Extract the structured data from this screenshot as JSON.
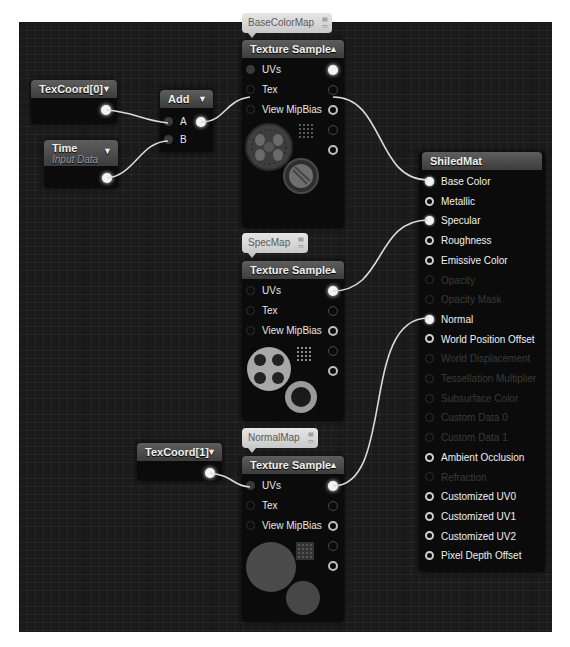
{
  "graph": {
    "nodes": {
      "texcoord0": {
        "title": "TexCoord[0]",
        "expand_icon": "chevron-down-icon"
      },
      "time": {
        "title": "Time",
        "subtitle": "Input Data",
        "expand_icon": "chevron-down-icon"
      },
      "add": {
        "title": "Add",
        "inputs": [
          "A",
          "B"
        ],
        "expand_icon": "chevron-down-icon"
      },
      "texcoord1": {
        "title": "TexCoord[1]",
        "expand_icon": "chevron-down-icon"
      },
      "tex_base": {
        "comment": "BaseColorMap",
        "title": "Texture Sample",
        "collapse_icon": "chevron-up-icon",
        "inputs": [
          "UVs",
          "Tex",
          "View MipBias"
        ]
      },
      "tex_spec": {
        "comment": "SpecMap",
        "title": "Texture Sample",
        "collapse_icon": "chevron-up-icon",
        "inputs": [
          "UVs",
          "Tex",
          "View MipBias"
        ]
      },
      "tex_normal": {
        "comment": "NormalMap",
        "title": "Texture Sample",
        "collapse_icon": "chevron-up-icon",
        "inputs": [
          "UVs",
          "Tex",
          "View MipBias"
        ]
      },
      "material": {
        "title": "ShiledMat",
        "inputs": [
          {
            "label": "Base Color",
            "enabled": true,
            "connected": true
          },
          {
            "label": "Metallic",
            "enabled": true,
            "connected": false
          },
          {
            "label": "Specular",
            "enabled": true,
            "connected": true
          },
          {
            "label": "Roughness",
            "enabled": true,
            "connected": false
          },
          {
            "label": "Emissive Color",
            "enabled": true,
            "connected": false
          },
          {
            "label": "Opacity",
            "enabled": false,
            "connected": false
          },
          {
            "label": "Opacity Mask",
            "enabled": false,
            "connected": false
          },
          {
            "label": "Normal",
            "enabled": true,
            "connected": true
          },
          {
            "label": "World Position Offset",
            "enabled": true,
            "connected": false
          },
          {
            "label": "World Displacement",
            "enabled": false,
            "connected": false
          },
          {
            "label": "Tessellation Multiplier",
            "enabled": false,
            "connected": false
          },
          {
            "label": "Subsurface Color",
            "enabled": false,
            "connected": false
          },
          {
            "label": "Custom Data 0",
            "enabled": false,
            "connected": false
          },
          {
            "label": "Custom Data 1",
            "enabled": false,
            "connected": false
          },
          {
            "label": "Ambient Occlusion",
            "enabled": true,
            "connected": false
          },
          {
            "label": "Refraction",
            "enabled": false,
            "connected": false
          },
          {
            "label": "Customized UV0",
            "enabled": true,
            "connected": false
          },
          {
            "label": "Customized UV1",
            "enabled": true,
            "connected": false
          },
          {
            "label": "Customized UV2",
            "enabled": true,
            "connected": false
          },
          {
            "label": "Pixel Depth Offset",
            "enabled": true,
            "connected": false
          }
        ]
      }
    },
    "connections": [
      {
        "from": "TexCoord[0]",
        "to": "Add.A"
      },
      {
        "from": "Time",
        "to": "Add.B"
      },
      {
        "from": "Add",
        "to": "BaseColorMap.UVs"
      },
      {
        "from": "BaseColorMap.RGB",
        "to": "ShiledMat.Base Color"
      },
      {
        "from": "SpecMap.RGB",
        "to": "ShiledMat.Specular"
      },
      {
        "from": "TexCoord[1]",
        "to": "NormalMap.UVs"
      },
      {
        "from": "NormalMap.RGB",
        "to": "ShiledMat.Normal"
      }
    ],
    "colors": {
      "canvas": "#1b1b1b",
      "node_body": "#0b0b0b",
      "header": "#4a4a4a",
      "comment_bubble": "#d8d8d8",
      "wire": "#d9d9d9"
    }
  }
}
